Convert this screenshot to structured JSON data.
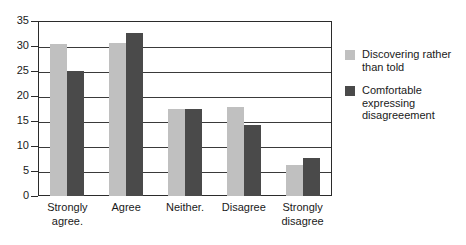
{
  "chart_data": {
    "type": "bar",
    "title": "",
    "xlabel": "",
    "ylabel": "",
    "ylim": [
      0,
      35
    ],
    "ytick_step": 5,
    "yticks": [
      35,
      30,
      25,
      20,
      15,
      10,
      5,
      0
    ],
    "grid": true,
    "legend_position": "right",
    "categories": [
      "Strongly agree.",
      "Agree",
      "Neither.",
      "Disagree",
      "Strongly disagree"
    ],
    "category_lines": [
      [
        "Strongly",
        "agree."
      ],
      [
        "Agree",
        ""
      ],
      [
        "Neither.",
        ""
      ],
      [
        "Disagree",
        ""
      ],
      [
        "Strongly",
        "disagree"
      ]
    ],
    "series": [
      {
        "name": "Discovering rather than told",
        "name_lines": [
          "Discovering rather",
          "than told"
        ],
        "color": "#c0c0c0",
        "values": [
          30.5,
          30.7,
          17.5,
          17.8,
          6.2
        ]
      },
      {
        "name": "Comfortable expressing disagreeement",
        "name_lines": [
          "Comfortable",
          "expressing",
          "disagreeement"
        ],
        "color": "#4a4a4a",
        "values": [
          25.1,
          32.6,
          17.5,
          14.3,
          7.7
        ]
      }
    ]
  },
  "colors": {
    "series_light": "#c0c0c0",
    "series_dark": "#4a4a4a",
    "axis": "#2b2b2b",
    "grid": "#3a3a3a",
    "background": "#ffffff"
  }
}
